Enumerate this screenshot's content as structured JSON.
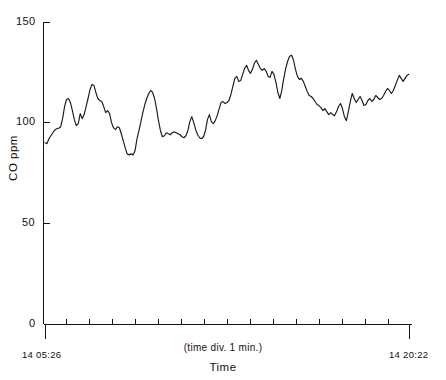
{
  "chart_data": {
    "type": "line",
    "title": "",
    "xlabel": "Time",
    "ylabel": "CO ppm",
    "ylim": [
      0,
      150
    ],
    "yticks": [
      0,
      50,
      100,
      150
    ],
    "ytick_labels": [
      "0",
      "50",
      "100",
      "150"
    ],
    "grid": false,
    "legend": null,
    "x_axis": {
      "start_label": "14 05:26",
      "end_label": "14 20:22",
      "division_note": "(time div. 1 min.)",
      "tick_count": 16,
      "start_day": "14",
      "start_time": "05:26",
      "end_day": "14",
      "end_time": "20:22"
    },
    "series": [
      {
        "name": "CO ppm",
        "color": "#1a1a1a",
        "values": [
          90.0,
          89.6,
          92.0,
          93.5,
          95.0,
          96.4,
          97.0,
          97.2,
          98.0,
          102.0,
          108.0,
          111.5,
          112.0,
          110.0,
          106.0,
          101.5,
          98.5,
          99.5,
          104.5,
          102.0,
          104.0,
          108.0,
          112.0,
          116.5,
          119.0,
          118.5,
          115.0,
          112.0,
          111.0,
          110.5,
          108.0,
          105.0,
          106.0,
          104.5,
          100.0,
          97.5,
          96.5,
          98.0,
          97.5,
          94.5,
          91.0,
          87.5,
          84.5,
          84.0,
          84.5,
          84.0,
          86.0,
          92.0,
          96.0,
          100.5,
          105.0,
          109.0,
          112.0,
          114.5,
          116.0,
          115.0,
          112.0,
          107.0,
          101.0,
          96.0,
          93.0,
          93.5,
          95.0,
          94.5,
          94.0,
          95.0,
          95.5,
          95.0,
          94.5,
          94.0,
          93.0,
          92.5,
          93.5,
          96.0,
          100.5,
          103.0,
          100.0,
          96.5,
          94.0,
          92.5,
          92.0,
          93.0,
          96.0,
          101.5,
          104.0,
          100.5,
          99.5,
          101.0,
          103.5,
          107.0,
          110.0,
          110.5,
          109.5,
          110.0,
          111.0,
          114.0,
          118.0,
          122.0,
          123.0,
          120.5,
          121.0,
          124.0,
          127.0,
          128.5,
          126.0,
          124.5,
          126.5,
          129.5,
          131.0,
          129.0,
          127.0,
          126.0,
          127.0,
          125.5,
          123.0,
          122.5,
          125.5,
          124.0,
          120.0,
          115.0,
          112.0,
          116.0,
          122.0,
          127.0,
          130.5,
          133.0,
          133.5,
          131.0,
          126.5,
          123.0,
          121.5,
          122.0,
          120.5,
          118.0,
          115.5,
          113.5,
          113.0,
          112.0,
          110.5,
          109.0,
          108.5,
          107.5,
          106.0,
          107.0,
          105.5,
          104.0,
          105.0,
          104.0,
          103.5,
          105.5,
          108.0,
          109.5,
          107.0,
          103.0,
          101.0,
          105.5,
          110.5,
          114.5,
          112.0,
          110.0,
          111.5,
          113.0,
          111.0,
          108.5,
          109.0,
          111.0,
          112.0,
          110.5,
          111.5,
          113.5,
          112.5,
          111.5,
          112.0,
          113.5,
          115.5,
          117.0,
          116.0,
          114.5,
          116.0,
          118.5,
          121.0,
          123.5,
          122.0,
          120.5,
          122.0,
          123.5,
          124.0
        ]
      }
    ]
  },
  "axis": {
    "y_title": "CO ppm",
    "x_title": "Time",
    "y_labels": {
      "t150": "150",
      "t100": "100",
      "t50": "50",
      "t0": "0"
    },
    "x_start": "14 05:26",
    "x_end": "14 20:22",
    "x_note": "(time div. 1 min.)"
  }
}
